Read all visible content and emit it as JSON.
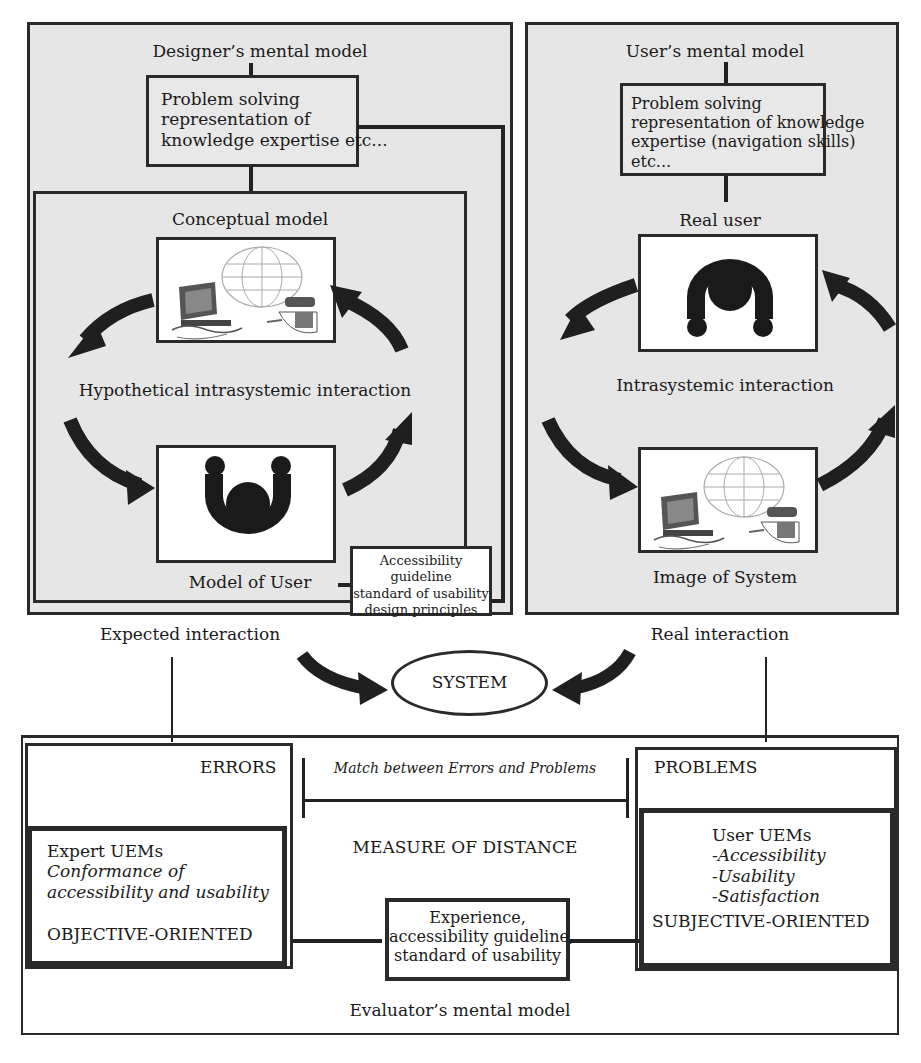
{
  "designer_panel": {
    "title": "Designer’s mental model",
    "knowledge_box": [
      "Problem solving",
      "representation of",
      "knowledge expertise etc..."
    ],
    "conceptual_model": {
      "title": "Conceptual model",
      "interaction_label": "Hypothetical intrasystemic interaction",
      "system_image_icon": "computer-globe-icon",
      "user_image_icon": "user-figure-icon",
      "user_label": "Model of User"
    },
    "guideline_box": [
      "Accessibility guideline",
      "standard of usability",
      "design principles"
    ]
  },
  "user_panel": {
    "title": "User’s mental model",
    "knowledge_box": [
      "Problem solving",
      "representation of knowledge",
      "expertise (navigation skills)",
      "etc..."
    ],
    "real_user_label": "Real user",
    "interaction_label": "Intrasystemic interaction",
    "system_label": "Image of System",
    "user_image_icon": "user-figure-icon",
    "system_image_icon": "computer-globe-icon"
  },
  "middle": {
    "expected_label": "Expected interaction",
    "real_label": "Real interaction",
    "system_label": "SYSTEM"
  },
  "evaluator": {
    "errors_label": "ERRORS",
    "problems_label": "PROBLEMS",
    "match_label": "Match between Errors and Problems",
    "measure_label": "MEASURE OF DISTANCE",
    "expert_box": {
      "title": "Expert UEMs",
      "lines": [
        "Conformance of",
        "accessibility and usability"
      ],
      "orientation": "OBJECTIVE-ORIENTED"
    },
    "user_box": {
      "title": "User UEMs",
      "items": [
        "-Accessibility",
        "-Usability",
        "-Satisfaction"
      ],
      "orientation": "SUBJECTIVE-ORIENTED"
    },
    "center_box": [
      "Experience,",
      "accessibility guideline,",
      "standard of usability"
    ],
    "footer_label": "Evaluator’s mental model"
  },
  "colors": {
    "panel_bg": "#e6e6e6",
    "stroke": "#2a2a2a",
    "arrow": "#1f1f1f"
  }
}
